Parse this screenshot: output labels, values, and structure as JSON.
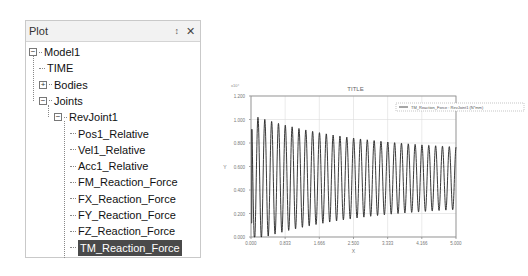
{
  "panel": {
    "title": "Plot",
    "pin_icon": "pin-icon",
    "close_icon": "close-icon",
    "tree": [
      {
        "label": "Model1",
        "level": 0,
        "expander": "minus"
      },
      {
        "label": "TIME",
        "level": 1,
        "expander": "none"
      },
      {
        "label": "Bodies",
        "level": 1,
        "expander": "plus"
      },
      {
        "label": "Joints",
        "level": 1,
        "expander": "minus"
      },
      {
        "label": "RevJoint1",
        "level": 2,
        "expander": "minus"
      },
      {
        "label": "Pos1_Relative",
        "level": 3,
        "expander": "none"
      },
      {
        "label": "Vel1_Relative",
        "level": 3,
        "expander": "none"
      },
      {
        "label": "Acc1_Relative",
        "level": 3,
        "expander": "none"
      },
      {
        "label": "FM_Reaction_Force",
        "level": 3,
        "expander": "none"
      },
      {
        "label": "FX_Reaction_Force",
        "level": 3,
        "expander": "none"
      },
      {
        "label": "FY_Reaction_Force",
        "level": 3,
        "expander": "none"
      },
      {
        "label": "FZ_Reaction_Force",
        "level": 3,
        "expander": "none"
      },
      {
        "label": "TM_Reaction_Force",
        "level": 3,
        "expander": "none",
        "selected": true
      },
      {
        "label": "TX_Reaction_Force",
        "level": 3,
        "expander": "none"
      }
    ]
  },
  "chart_data": {
    "type": "line",
    "title": "TITLE",
    "xlabel": "X",
    "ylabel": "Y",
    "y_multiplier": "x10^4",
    "xlim": [
      0,
      5
    ],
    "ylim": [
      0,
      1.2
    ],
    "x_ticks": [
      "0.000",
      "0.833",
      "1.666",
      "2.500",
      "3.333",
      "4.166",
      "5.000"
    ],
    "y_ticks": [
      "0.000",
      "0.200",
      "0.400",
      "0.600",
      "0.800",
      "1.000",
      "1.200"
    ],
    "grid": true,
    "legend_position": "upper-right-outside",
    "series": [
      {
        "name": "TM_Reaction_Force : RevJoint1 (N*mm)",
        "description": "damped oscillation, ~30 cycles over 0-5 s, centered ~0.5",
        "x": [
          0.0,
          0.05,
          0.08,
          0.5,
          1.0,
          1.5,
          2.0,
          2.5,
          3.0,
          3.5,
          4.0,
          4.5,
          5.0
        ],
        "envelope_max": [
          null,
          null,
          1.04,
          0.99,
          0.94,
          0.9,
          0.86,
          0.83,
          0.8,
          0.77,
          0.75,
          0.73,
          0.72
        ],
        "envelope_min": [
          0.1,
          0.05,
          null,
          0.08,
          0.1,
          0.13,
          0.16,
          0.19,
          0.21,
          0.23,
          0.25,
          0.26,
          0.27
        ],
        "frequency_hz": 6
      }
    ]
  },
  "legend": {
    "label": "TM_Reaction_Force : RevJoint1 (N*mm)"
  }
}
